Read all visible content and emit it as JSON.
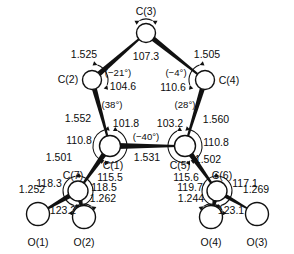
{
  "figure": {
    "type": "molecular-structure-diagram",
    "atoms": [
      {
        "id": "C3",
        "label": "C(3)",
        "x": 146,
        "y": 33,
        "r": 9.5,
        "label_x": 146,
        "label_y": 12,
        "anchor": "middle"
      },
      {
        "id": "C2",
        "label": "C(2)",
        "x": 92,
        "y": 80,
        "r": 9.5,
        "label_x": 68,
        "label_y": 80,
        "anchor": "middle"
      },
      {
        "id": "C4",
        "label": "C(4)",
        "x": 205,
        "y": 80,
        "r": 9.5,
        "label_x": 229,
        "label_y": 81,
        "anchor": "middle"
      },
      {
        "id": "C1",
        "label": "C(1)",
        "x": 110,
        "y": 146,
        "r": 10.5,
        "label_x": 113,
        "label_y": 166,
        "anchor": "middle"
      },
      {
        "id": "C5",
        "label": "C(5)",
        "x": 185,
        "y": 146,
        "r": 10.5,
        "label_x": 180,
        "label_y": 166,
        "anchor": "middle"
      },
      {
        "id": "C7",
        "label": "C(7)",
        "x": 78,
        "y": 191,
        "r": 10.0,
        "label_x": 73,
        "label_y": 176,
        "anchor": "middle"
      },
      {
        "id": "C6",
        "label": "C(6)",
        "x": 217,
        "y": 191,
        "r": 10.0,
        "label_x": 222,
        "label_y": 176,
        "anchor": "middle"
      },
      {
        "id": "O1",
        "label": "O(1)",
        "x": 38,
        "y": 214,
        "r": 11.5,
        "label_x": 38,
        "label_y": 243,
        "anchor": "middle"
      },
      {
        "id": "O2",
        "label": "O(2)",
        "x": 84,
        "y": 217,
        "r": 11.5,
        "label_x": 84,
        "label_y": 243,
        "anchor": "middle"
      },
      {
        "id": "O4",
        "label": "O(4)",
        "x": 211,
        "y": 217,
        "r": 11.5,
        "label_x": 211,
        "label_y": 243,
        "anchor": "middle"
      },
      {
        "id": "O3",
        "label": "O(3)",
        "x": 257,
        "y": 214,
        "r": 11.5,
        "label_x": 257,
        "label_y": 243,
        "anchor": "middle"
      }
    ],
    "bond_lengths": [
      {
        "between": "C(2)-C(3)",
        "value": "1.525",
        "x": 84,
        "y": 55
      },
      {
        "between": "C(3)-C(4)",
        "value": "1.505",
        "x": 207,
        "y": 55
      },
      {
        "between": "C(2)-C(1)",
        "value": "1.552",
        "x": 78,
        "y": 119
      },
      {
        "between": "C(4)-C(5)",
        "value": "1.560",
        "x": 216,
        "y": 120
      },
      {
        "between": "C(1)-C(5)",
        "value": "1.531",
        "x": 147,
        "y": 158
      },
      {
        "between": "C(1)-C(7)",
        "value": "1.501",
        "x": 59,
        "y": 158
      },
      {
        "between": "C(5)-C(6)",
        "value": "1.502",
        "x": 208,
        "y": 160
      },
      {
        "between": "C(7)-O(1)",
        "value": "1.252",
        "x": 32,
        "y": 190
      },
      {
        "between": "C(7)-O(2)",
        "value": "1.262",
        "x": 103,
        "y": 199
      },
      {
        "between": "C(6)-O(4)",
        "value": "1.244",
        "x": 191,
        "y": 199
      },
      {
        "between": "C(6)-O(3)",
        "value": "1.269",
        "x": 256,
        "y": 190
      }
    ],
    "bond_angles": [
      {
        "at": "C(3)",
        "value": "107.3",
        "x": 146,
        "y": 57
      },
      {
        "at": "C(2)",
        "value": "104.6",
        "x": 123,
        "y": 87
      },
      {
        "at": "C(4)",
        "value": "110.6",
        "x": 173,
        "y": 88
      },
      {
        "at": "C(1)",
        "value": "101.8",
        "x": 126,
        "y": 124
      },
      {
        "at": "C(5)",
        "value": "103.2",
        "x": 170,
        "y": 124
      },
      {
        "at": "C(1)",
        "value": "110.8",
        "x": 79,
        "y": 141
      },
      {
        "at": "C(5)",
        "value": "110.8",
        "x": 216,
        "y": 143
      },
      {
        "at": "C(1)",
        "value": "115.5",
        "x": 110,
        "y": 178
      },
      {
        "at": "C(5)",
        "value": "115.6",
        "x": 186,
        "y": 178
      },
      {
        "at": "C(7)",
        "value": "118.3",
        "x": 49,
        "y": 184
      },
      {
        "at": "C(7)",
        "value": "118.5",
        "x": 104,
        "y": 188
      },
      {
        "at": "C(7)",
        "value": "123.2",
        "x": 63,
        "y": 211
      },
      {
        "at": "C(6)",
        "value": "119.7",
        "x": 190,
        "y": 188
      },
      {
        "at": "C(6)",
        "value": "117.1",
        "x": 245,
        "y": 184
      },
      {
        "at": "C(6)",
        "value": "123.1",
        "x": 231,
        "y": 211
      }
    ],
    "torsion_angles": [
      {
        "value": "(−21°)",
        "x": 118,
        "y": 73
      },
      {
        "value": "(−4°)",
        "x": 176,
        "y": 73
      },
      {
        "value": "(38°)",
        "x": 112,
        "y": 105
      },
      {
        "value": "(28°)",
        "x": 185,
        "y": 105
      },
      {
        "value": "(−40°)",
        "x": 146,
        "y": 137
      }
    ],
    "bonds": [
      {
        "from": "C2",
        "to": "C3",
        "width": 5.0
      },
      {
        "from": "C3",
        "to": "C4",
        "width": 5.0
      },
      {
        "from": "C2",
        "to": "C1",
        "width": 5.0
      },
      {
        "from": "C4",
        "to": "C5",
        "width": 5.0
      },
      {
        "from": "C1",
        "to": "C5",
        "width": 5.6
      },
      {
        "from": "C1",
        "to": "C7",
        "width": 5.2
      },
      {
        "from": "C5",
        "to": "C6",
        "width": 5.2
      },
      {
        "from": "C7",
        "to": "O1",
        "width": 5.0
      },
      {
        "from": "C7",
        "to": "O2",
        "width": 5.0
      },
      {
        "from": "C6",
        "to": "O4",
        "width": 5.0
      },
      {
        "from": "C6",
        "to": "O3",
        "width": 4.0
      }
    ],
    "arcs": [
      {
        "cx": 146,
        "cy": 33,
        "r": 14,
        "a0": 62,
        "a1": 118,
        "arrows": "both"
      },
      {
        "cx": 92,
        "cy": 80,
        "r": 16,
        "a0": -18,
        "a1": 70,
        "arrows": "both"
      },
      {
        "cx": 205,
        "cy": 80,
        "r": 16,
        "a0": 110,
        "a1": 198,
        "arrows": "both"
      },
      {
        "cx": 110,
        "cy": 146,
        "r": 17,
        "a0": -92,
        "a1": 62,
        "arrows": "both"
      },
      {
        "cx": 110,
        "cy": 146,
        "r": 17,
        "a0": 108,
        "a1": 232,
        "arrows": "both"
      },
      {
        "cx": 185,
        "cy": 146,
        "r": 17,
        "a0": 118,
        "a1": 272,
        "arrows": "both"
      },
      {
        "cx": 185,
        "cy": 146,
        "r": 17,
        "a0": -52,
        "a1": 72,
        "arrows": "both"
      },
      {
        "cx": 78,
        "cy": 191,
        "r": 15,
        "a0": -80,
        "a1": 75,
        "arrows": "both"
      },
      {
        "cx": 78,
        "cy": 191,
        "r": 15,
        "a0": 100,
        "a1": 255,
        "arrows": "both"
      },
      {
        "cx": 217,
        "cy": 191,
        "r": 15,
        "a0": 105,
        "a1": 260,
        "arrows": "both"
      },
      {
        "cx": 217,
        "cy": 191,
        "r": 15,
        "a0": -75,
        "a1": 80,
        "arrows": "both"
      },
      {
        "cx": 84,
        "cy": 217,
        "r": 13,
        "a0": 55,
        "a1": 150,
        "arrows": "both"
      },
      {
        "cx": 211,
        "cy": 217,
        "r": 13,
        "a0": 30,
        "a1": 125,
        "arrows": "both"
      }
    ]
  }
}
